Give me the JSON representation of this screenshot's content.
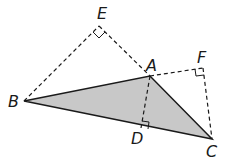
{
  "diagram": {
    "title": "",
    "points": {
      "A": {
        "label": "A",
        "x": 150,
        "y": 76
      },
      "B": {
        "label": "B",
        "x": 24,
        "y": 101
      },
      "C": {
        "label": "C",
        "x": 212,
        "y": 139
      },
      "D": {
        "label": "D",
        "x": 141,
        "y": 128
      },
      "E": {
        "label": "E",
        "x": 99,
        "y": 26
      },
      "F": {
        "label": "F",
        "x": 203,
        "y": 68
      }
    },
    "shaded_triangle": "ABC",
    "solid_segments": [
      "AB",
      "BC",
      "CA"
    ],
    "dashed_segments": [
      "BE",
      "EA",
      "AF",
      "FC",
      "AD"
    ],
    "right_angles": [
      "E",
      "F",
      "D"
    ],
    "colors": {
      "fill": "#c8c8c8",
      "stroke": "#1a1a1a"
    }
  }
}
